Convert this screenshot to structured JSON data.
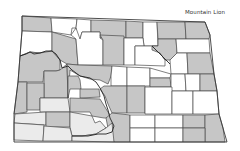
{
  "map": {
    "title": "Mountain Lion",
    "region": "North Dakota counties",
    "colors": {
      "present": "#c6c6c6",
      "light": "#ececec",
      "absent": "#ffffff",
      "border": "#4a4a4a"
    },
    "legend": []
  }
}
